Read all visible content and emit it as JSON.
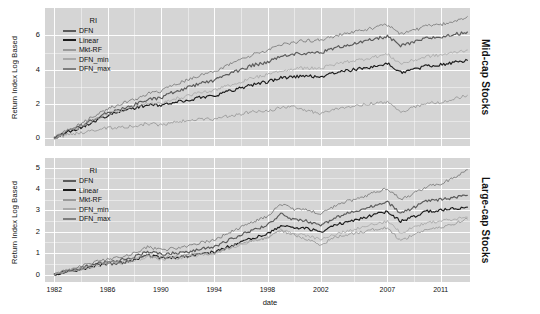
{
  "chart_data": {
    "type": "line",
    "title": "",
    "xlabel": "date",
    "ylabel": "Return Index Log Based",
    "grid": true,
    "legend_position": "top-left inside panel",
    "legend_title": "RI",
    "x_ticks": [
      "1982",
      "1986",
      "1990",
      "1994",
      "1998",
      "2002",
      "2007",
      "2011"
    ],
    "x_tick_values": [
      1982,
      1986,
      1990,
      1994,
      1998,
      2002,
      2007,
      2011
    ],
    "xlim": [
      1981.3,
      2013.2
    ],
    "series_names": [
      "DFN",
      "Linear",
      "Mkt-RF",
      "DFN_min",
      "DFN_max"
    ],
    "series_colors": [
      "#5a5a5a",
      "#1c1c1c",
      "#9a9a9a",
      "#aaaaaa",
      "#7d7d7d"
    ],
    "facets": [
      {
        "strip_label": "Mid-cap Stocks",
        "ylim": [
          -0.45,
          7.6
        ],
        "y_ticks": [
          "0",
          "2",
          "4",
          "6"
        ],
        "y_tick_values": [
          0,
          2,
          4,
          6
        ],
        "series": [
          {
            "name": "DFN",
            "x": [
              1982,
              1983,
              1984,
              1985,
              1986,
              1987,
              1988,
              1989,
              1990,
              1991,
              1992,
              1993,
              1994,
              1995,
              1996,
              1997,
              1998,
              1999,
              2000,
              2001,
              2002,
              2003,
              2004,
              2005,
              2006,
              2007,
              2008,
              2009,
              2010,
              2011,
              2012,
              2013
            ],
            "values": [
              0.0,
              0.45,
              0.72,
              1.12,
              1.5,
              1.72,
              1.95,
              2.25,
              2.35,
              2.72,
              2.95,
              3.22,
              3.38,
              3.72,
              4.0,
              4.28,
              4.45,
              4.78,
              4.9,
              4.98,
              5.0,
              5.25,
              5.45,
              5.58,
              5.78,
              5.95,
              5.38,
              5.6,
              5.85,
              5.9,
              6.05,
              6.2
            ]
          },
          {
            "name": "Linear",
            "x": [
              1982,
              1983,
              1984,
              1985,
              1986,
              1987,
              1988,
              1989,
              1990,
              1991,
              1992,
              1993,
              1994,
              1995,
              1996,
              1997,
              1998,
              1999,
              2000,
              2001,
              2002,
              2003,
              2004,
              2005,
              2006,
              2007,
              2008,
              2009,
              2010,
              2011,
              2012,
              2013
            ],
            "values": [
              0.0,
              0.4,
              0.62,
              1.0,
              1.35,
              1.55,
              1.78,
              1.95,
              1.92,
              2.1,
              2.2,
              2.4,
              2.5,
              2.72,
              2.95,
              3.15,
              3.3,
              3.52,
              3.6,
              3.62,
              3.6,
              3.8,
              3.95,
              4.05,
              4.2,
              4.35,
              3.85,
              4.02,
              4.22,
              4.3,
              4.42,
              4.55
            ]
          },
          {
            "name": "Mkt-RF",
            "x": [
              1982,
              1983,
              1984,
              1985,
              1986,
              1987,
              1988,
              1989,
              1990,
              1991,
              1992,
              1993,
              1994,
              1995,
              1996,
              1997,
              1998,
              1999,
              2000,
              2001,
              2002,
              2003,
              2004,
              2005,
              2006,
              2007,
              2008,
              2009,
              2010,
              2011,
              2012,
              2013
            ],
            "values": [
              0.0,
              0.22,
              0.3,
              0.45,
              0.6,
              0.62,
              0.72,
              0.85,
              0.78,
              0.95,
              1.02,
              1.12,
              1.1,
              1.28,
              1.42,
              1.55,
              1.6,
              1.78,
              1.82,
              1.6,
              1.45,
              1.72,
              1.85,
              1.92,
              2.05,
              2.1,
              1.55,
              1.82,
              2.05,
              2.1,
              2.3,
              2.5
            ]
          },
          {
            "name": "DFN_min",
            "x": [
              1982,
              1983,
              1984,
              1985,
              1986,
              1987,
              1988,
              1989,
              1990,
              1991,
              1992,
              1993,
              1994,
              1995,
              1996,
              1997,
              1998,
              1999,
              2000,
              2001,
              2002,
              2003,
              2004,
              2005,
              2006,
              2007,
              2008,
              2009,
              2010,
              2011,
              2012,
              2013
            ],
            "values": [
              0.0,
              0.42,
              0.66,
              1.05,
              1.42,
              1.62,
              1.85,
              2.05,
              2.05,
              2.3,
              2.45,
              2.68,
              2.78,
              3.05,
              3.3,
              3.55,
              3.7,
              3.95,
              4.05,
              4.1,
              4.08,
              4.3,
              4.48,
              4.58,
              4.75,
              4.9,
              4.35,
              4.55,
              4.78,
              4.85,
              5.0,
              5.15
            ]
          },
          {
            "name": "DFN_max",
            "x": [
              1982,
              1983,
              1984,
              1985,
              1986,
              1987,
              1988,
              1989,
              1990,
              1991,
              1992,
              1993,
              1994,
              1995,
              1996,
              1997,
              1998,
              1999,
              2000,
              2001,
              2002,
              2003,
              2004,
              2005,
              2006,
              2007,
              2008,
              2009,
              2010,
              2011,
              2012,
              2013
            ],
            "values": [
              0.0,
              0.52,
              0.85,
              1.3,
              1.72,
              2.0,
              2.25,
              2.6,
              2.75,
              3.12,
              3.4,
              3.7,
              3.88,
              4.25,
              4.58,
              4.9,
              5.1,
              5.45,
              5.6,
              5.7,
              5.72,
              5.95,
              6.15,
              6.28,
              6.45,
              6.62,
              6.1,
              6.3,
              6.55,
              6.6,
              6.85,
              7.1
            ]
          }
        ]
      },
      {
        "strip_label": "Large-cap Stocks",
        "ylim": [
          -0.35,
          5.45
        ],
        "y_ticks": [
          "0",
          "1",
          "2",
          "3",
          "4",
          "5"
        ],
        "y_tick_values": [
          0,
          1,
          2,
          3,
          4,
          5
        ],
        "series": [
          {
            "name": "DFN",
            "x": [
              1982,
              1983,
              1984,
              1985,
              1986,
              1987,
              1988,
              1989,
              1990,
              1991,
              1992,
              1993,
              1994,
              1995,
              1996,
              1997,
              1998,
              1999,
              2000,
              2001,
              2002,
              2003,
              2004,
              2005,
              2006,
              2007,
              2008,
              2009,
              2010,
              2011,
              2012,
              2013
            ],
            "values": [
              0.0,
              0.18,
              0.3,
              0.48,
              0.6,
              0.68,
              0.82,
              1.08,
              0.95,
              1.0,
              1.05,
              1.2,
              1.3,
              1.58,
              1.85,
              2.1,
              2.3,
              2.85,
              2.55,
              2.5,
              2.28,
              2.62,
              2.85,
              3.0,
              3.22,
              3.4,
              2.85,
              3.15,
              3.45,
              3.5,
              3.6,
              3.7
            ]
          },
          {
            "name": "Linear",
            "x": [
              1982,
              1983,
              1984,
              1985,
              1986,
              1987,
              1988,
              1989,
              1990,
              1991,
              1992,
              1993,
              1994,
              1995,
              1996,
              1997,
              1998,
              1999,
              2000,
              2001,
              2002,
              2003,
              2004,
              2005,
              2006,
              2007,
              2008,
              2009,
              2010,
              2011,
              2012,
              2013
            ],
            "values": [
              0.0,
              0.15,
              0.25,
              0.4,
              0.5,
              0.55,
              0.68,
              0.9,
              0.78,
              0.8,
              0.85,
              0.98,
              1.05,
              1.28,
              1.52,
              1.72,
              1.9,
              2.3,
              2.15,
              2.15,
              2.0,
              2.28,
              2.48,
              2.62,
              2.8,
              2.95,
              2.48,
              2.72,
              2.95,
              3.0,
              3.08,
              3.15
            ]
          },
          {
            "name": "Mkt-RF",
            "x": [
              1982,
              1983,
              1984,
              1985,
              1986,
              1987,
              1988,
              1989,
              1990,
              1991,
              1992,
              1993,
              1994,
              1995,
              1996,
              1997,
              1998,
              1999,
              2000,
              2001,
              2002,
              2003,
              2004,
              2005,
              2006,
              2007,
              2008,
              2009,
              2010,
              2011,
              2012,
              2013
            ],
            "values": [
              0.0,
              0.2,
              0.28,
              0.45,
              0.58,
              0.58,
              0.7,
              0.92,
              0.78,
              0.85,
              0.9,
              1.0,
              0.98,
              1.22,
              1.45,
              1.62,
              1.7,
              2.05,
              1.85,
              1.62,
              1.4,
              1.72,
              1.88,
              1.98,
              2.12,
              2.18,
              1.58,
              1.88,
              2.12,
              2.18,
              2.38,
              2.6
            ]
          },
          {
            "name": "DFN_min",
            "x": [
              1982,
              1983,
              1984,
              1985,
              1986,
              1987,
              1988,
              1989,
              1990,
              1991,
              1992,
              1993,
              1994,
              1995,
              1996,
              1997,
              1998,
              1999,
              2000,
              2001,
              2002,
              2003,
              2004,
              2005,
              2006,
              2007,
              2008,
              2009,
              2010,
              2011,
              2012,
              2013
            ],
            "values": [
              0.0,
              0.14,
              0.24,
              0.38,
              0.48,
              0.52,
              0.62,
              0.85,
              0.72,
              0.75,
              0.8,
              0.92,
              1.0,
              1.2,
              1.42,
              1.6,
              1.72,
              2.1,
              1.9,
              1.82,
              1.62,
              1.88,
              2.05,
              2.18,
              2.35,
              2.48,
              1.95,
              2.2,
              2.45,
              2.5,
              2.6,
              2.68
            ]
          },
          {
            "name": "DFN_max",
            "x": [
              1982,
              1983,
              1984,
              1985,
              1986,
              1987,
              1988,
              1989,
              1990,
              1991,
              1992,
              1993,
              1994,
              1995,
              1996,
              1997,
              1998,
              1999,
              2000,
              2001,
              2002,
              2003,
              2004,
              2005,
              2006,
              2007,
              2008,
              2009,
              2010,
              2011,
              2012,
              2013
            ],
            "values": [
              0.0,
              0.22,
              0.38,
              0.58,
              0.72,
              0.82,
              1.0,
              1.28,
              1.15,
              1.22,
              1.3,
              1.48,
              1.6,
              1.92,
              2.22,
              2.5,
              2.72,
              3.3,
              3.05,
              3.02,
              2.82,
              3.18,
              3.42,
              3.58,
              3.82,
              4.02,
              3.5,
              3.8,
              4.12,
              4.22,
              4.55,
              4.9
            ]
          }
        ]
      }
    ]
  }
}
